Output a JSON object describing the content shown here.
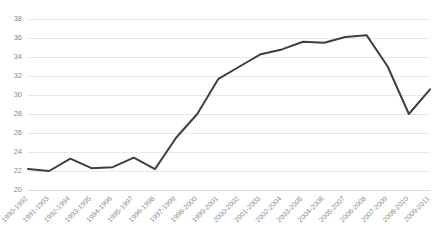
{
  "chart_data": {
    "type": "line",
    "title": "",
    "subtitle": "",
    "xlabel": "",
    "ylabel": "",
    "ylim": [
      20,
      38
    ],
    "ytick_step": 2,
    "yticks": [
      20,
      22,
      24,
      26,
      28,
      30,
      32,
      34,
      36,
      38
    ],
    "grid": true,
    "legend": false,
    "legend_position": "none",
    "line_color": "#3f3f3f",
    "grid_color": "#e8e8e8",
    "tick_label_color": "#8a8a8a",
    "categories": [
      "1990-1992",
      "1991-1993",
      "1992-1994",
      "1993-1995",
      "1994-1996",
      "1995-1997",
      "1996-1998",
      "1997-1999",
      "1998-2000",
      "1999-2001",
      "2000-2002",
      "2001-2003",
      "2002-2004",
      "2003-2005",
      "2004-2006",
      "2005-2007",
      "2006-2008",
      "2007-2009",
      "2008-2010",
      "2009-2011"
    ],
    "series": [
      {
        "name": "value",
        "values": [
          22.2,
          22.0,
          23.3,
          22.3,
          22.4,
          23.4,
          22.2,
          25.5,
          28.0,
          31.7,
          33.0,
          34.3,
          34.8,
          35.6,
          35.5,
          36.1,
          36.3,
          33.0,
          28.0,
          30.6
        ]
      }
    ]
  }
}
